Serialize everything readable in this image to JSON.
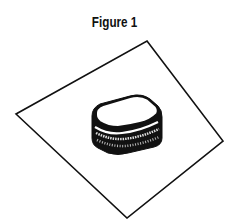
{
  "figure": {
    "title": "Figure 1",
    "objects": [
      "plate",
      "sandwich"
    ],
    "colors": {
      "ink": "#111111",
      "background": "#ffffff"
    }
  }
}
